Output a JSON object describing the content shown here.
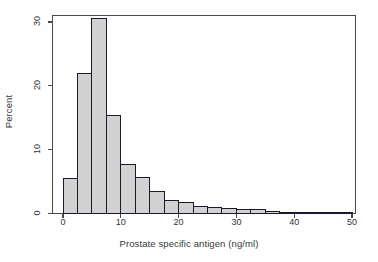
{
  "chart_data": {
    "type": "bar",
    "title": "",
    "subtitle": "",
    "xlabel": "Prostate specific antigen (ng/ml)",
    "ylabel": "Percent",
    "xlim": [
      0,
      51.5
    ],
    "ylim": [
      0,
      31.5
    ],
    "xticks": [
      0,
      10,
      20,
      30,
      40,
      50
    ],
    "xtick_labels": [
      "0",
      "10",
      "20",
      "30",
      "40",
      "50"
    ],
    "yticks": [
      0,
      10,
      20,
      30
    ],
    "ytick_labels": [
      "0",
      "10",
      "20",
      "30"
    ],
    "grid": false,
    "legend": null,
    "bin_width": 2.5,
    "bin_edges": [
      0,
      2.5,
      5,
      7.5,
      10,
      12.5,
      15,
      17.5,
      20,
      22.5,
      25,
      27.5,
      30,
      32.5,
      35,
      37.5,
      40,
      42.5,
      45,
      47.5,
      50
    ],
    "categories": [
      "0-2.5",
      "2.5-5",
      "5-7.5",
      "7.5-10",
      "10-12.5",
      "12.5-15",
      "15-17.5",
      "17.5-20",
      "20-22.5",
      "22.5-25",
      "25-27.5",
      "27.5-30",
      "30-32.5",
      "32.5-35",
      "35-37.5",
      "37.5-40",
      "40-42.5",
      "42.5-45",
      "45-47.5",
      "47.5-50"
    ],
    "values": [
      5.5,
      22.0,
      30.5,
      15.3,
      7.7,
      5.6,
      3.4,
      2.1,
      1.8,
      1.1,
      1.0,
      0.8,
      0.7,
      0.6,
      0.3,
      0.2,
      0.2,
      0.2,
      0.15,
      0.15
    ],
    "bar_fill_color": "#d2d2d2",
    "bar_edge_color": "#1a1a2e",
    "baseline_color": "#3f9a5a",
    "frame_color": "#4a4a4a",
    "background_color": "#fefefe"
  }
}
